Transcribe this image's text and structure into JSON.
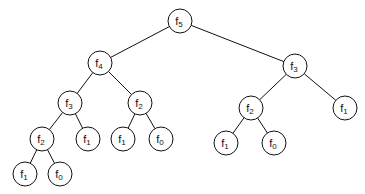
{
  "diagram": {
    "type": "tree",
    "nodes": [
      {
        "id": "n0",
        "base": "f",
        "sub": "5",
        "x": 180,
        "y": 21
      },
      {
        "id": "n1",
        "base": "f",
        "sub": "4",
        "x": 100,
        "y": 63
      },
      {
        "id": "n2",
        "base": "f",
        "sub": "3",
        "x": 295,
        "y": 66
      },
      {
        "id": "n3",
        "base": "f",
        "sub": "3",
        "x": 70,
        "y": 103
      },
      {
        "id": "n4",
        "base": "f",
        "sub": "2",
        "x": 140,
        "y": 103
      },
      {
        "id": "n5",
        "base": "f",
        "sub": "2",
        "x": 251,
        "y": 108
      },
      {
        "id": "n6",
        "base": "f",
        "sub": "1",
        "x": 345,
        "y": 108
      },
      {
        "id": "n7",
        "base": "f",
        "sub": "2",
        "x": 42,
        "y": 139
      },
      {
        "id": "n8",
        "base": "f",
        "sub": "1",
        "x": 88,
        "y": 139
      },
      {
        "id": "n9",
        "base": "f",
        "sub": "1",
        "x": 123,
        "y": 139
      },
      {
        "id": "n10",
        "base": "f",
        "sub": "0",
        "x": 161,
        "y": 139
      },
      {
        "id": "n11",
        "base": "f",
        "sub": "1",
        "x": 226,
        "y": 143
      },
      {
        "id": "n12",
        "base": "f",
        "sub": "0",
        "x": 274,
        "y": 143
      },
      {
        "id": "n13",
        "base": "f",
        "sub": "1",
        "x": 25,
        "y": 174
      },
      {
        "id": "n14",
        "base": "f",
        "sub": "0",
        "x": 60,
        "y": 174
      }
    ],
    "edges": [
      [
        "n0",
        "n1"
      ],
      [
        "n0",
        "n2"
      ],
      [
        "n1",
        "n3"
      ],
      [
        "n1",
        "n4"
      ],
      [
        "n2",
        "n5"
      ],
      [
        "n2",
        "n6"
      ],
      [
        "n3",
        "n7"
      ],
      [
        "n3",
        "n8"
      ],
      [
        "n4",
        "n9"
      ],
      [
        "n4",
        "n10"
      ],
      [
        "n5",
        "n11"
      ],
      [
        "n5",
        "n12"
      ],
      [
        "n7",
        "n13"
      ],
      [
        "n7",
        "n14"
      ]
    ],
    "node_radius": 12
  }
}
